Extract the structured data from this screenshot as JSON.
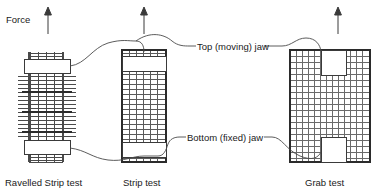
{
  "figure": {
    "background_color": "#ffffff",
    "line_color": "#3a3a3a",
    "text_color": "#1a1a1a"
  },
  "labels": {
    "force": "Force",
    "top_jaw": "Top (moving) jaw",
    "bottom_jaw": "Bottom (fixed) jaw"
  },
  "captions": {
    "ravelled_strip": "Ravelled Strip test",
    "strip": "Strip test",
    "grab": "Grab test"
  },
  "icons": {
    "force_arrow": "up-arrow-icon",
    "leader_line": "curved-leader-line-icon"
  },
  "specimens": [
    {
      "id": "ravelled-strip",
      "caption": "Ravelled Strip test",
      "x": 25,
      "y": 52,
      "w": 44,
      "h": 110,
      "weave_cols": 5,
      "weave_rows": 18,
      "ravelled": true,
      "ravel_overhang": 7,
      "top_jaw": {
        "x": 24,
        "y": 59,
        "w": 46,
        "h": 14
      },
      "bottom_jaw": {
        "x": 24,
        "y": 140,
        "w": 46,
        "h": 14
      },
      "arrow_x": 48
    },
    {
      "id": "strip",
      "caption": "Strip test",
      "x": 122,
      "y": 50,
      "w": 44,
      "h": 112,
      "weave_cols": 6,
      "weave_rows": 19,
      "ravelled": false,
      "top_jaw": {
        "x": 122,
        "y": 56,
        "w": 44,
        "h": 14
      },
      "bottom_jaw": {
        "x": 122,
        "y": 142,
        "w": 44,
        "h": 14
      },
      "arrow_x": 144
    },
    {
      "id": "grab",
      "caption": "Grab test",
      "x": 290,
      "y": 50,
      "w": 80,
      "h": 112,
      "weave_cols": 13,
      "weave_rows": 18,
      "ravelled": false,
      "top_jaw": {
        "x": 321,
        "y": 50,
        "w": 24,
        "h": 24
      },
      "bottom_jaw": {
        "x": 321,
        "y": 138,
        "w": 24,
        "h": 24
      },
      "arrow_x": 338
    }
  ],
  "arrows": [
    {
      "name": "force-arrow-ravelled",
      "x": 48,
      "y_top": 8,
      "y_bottom": 34
    },
    {
      "name": "force-arrow-strip",
      "x": 144,
      "y_top": 8,
      "y_bottom": 34
    },
    {
      "name": "force-arrow-grab",
      "x": 338,
      "y_top": 8,
      "y_bottom": 34
    }
  ],
  "leader_lines": [
    {
      "name": "top-jaw-leader",
      "from": "top-jaws",
      "to": "Top (moving) jaw"
    },
    {
      "name": "bottom-jaw-leader",
      "from": "bottom-jaws",
      "to": "Bottom (fixed) jaw"
    }
  ]
}
